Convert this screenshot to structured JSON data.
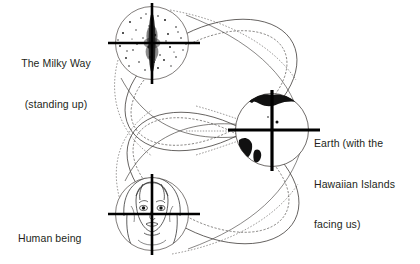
{
  "figure": {
    "background_color": "#ffffff",
    "ink_color": "#231f20",
    "labels": {
      "milky_way": {
        "line1": "The Milky Way",
        "line2": "(standing up)"
      },
      "earth": {
        "line1": "Earth (with the",
        "line2": "Hawaiian Islands",
        "line3": "facing us)"
      },
      "human": {
        "line1": "Human being"
      }
    },
    "nodes": [
      {
        "name": "milky-way",
        "cx": 152,
        "cy": 43,
        "r": 37,
        "crosshair_v_top": 3,
        "crosshair_v_bottom": 84,
        "crosshair_h_left": 108,
        "crosshair_h_right": 200
      },
      {
        "name": "earth",
        "cx": 272,
        "cy": 130,
        "r": 37,
        "crosshair_v_top": 90,
        "crosshair_v_bottom": 171,
        "crosshair_h_left": 228,
        "crosshair_h_right": 320
      },
      {
        "name": "human-being",
        "cx": 152,
        "cy": 214,
        "r": 37,
        "crosshair_v_top": 174,
        "crosshair_v_bottom": 255,
        "crosshair_h_left": 108,
        "crosshair_h_right": 200
      }
    ],
    "orbits": [
      {
        "name": "upper-orbit",
        "rx": 88,
        "ry": 54,
        "cx": 210,
        "cy": 86,
        "rotation": -28
      },
      {
        "name": "lower-orbit",
        "rx": 88,
        "ry": 54,
        "cx": 212,
        "cy": 178,
        "rotation": 28
      }
    ]
  }
}
